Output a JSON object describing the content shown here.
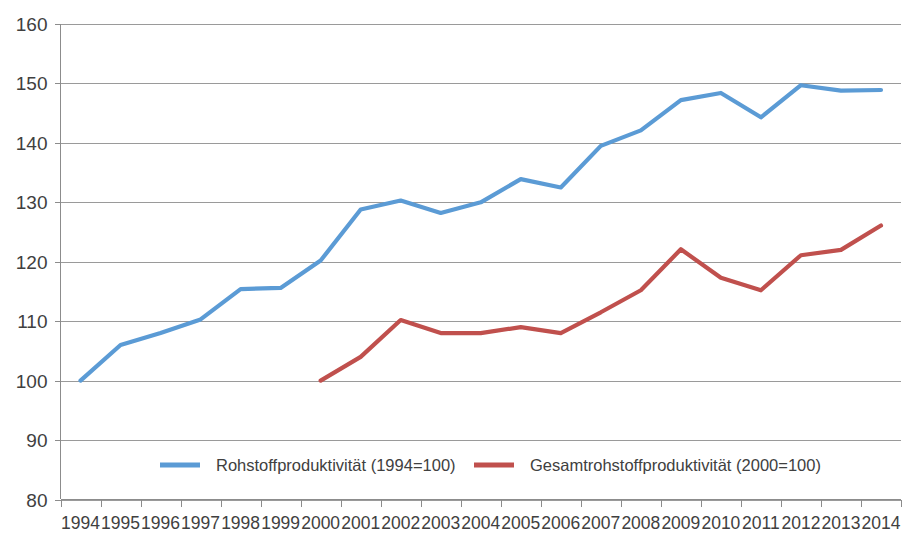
{
  "chart_data": {
    "type": "line",
    "title": "",
    "subtitle": "",
    "xlabel": "",
    "ylabel": "",
    "x": [
      1994,
      1995,
      1996,
      1997,
      1998,
      1999,
      2000,
      2001,
      2002,
      2003,
      2004,
      2005,
      2006,
      2007,
      2008,
      2009,
      2010,
      2011,
      2012,
      2013,
      2014
    ],
    "categories": [
      "1994",
      "1995",
      "1996",
      "1997",
      "1998",
      "1999",
      "2000",
      "2001",
      "2002",
      "2003",
      "2004",
      "2005",
      "2006",
      "2007",
      "2008",
      "2009",
      "2010",
      "2011",
      "2012",
      "2013",
      "2014"
    ],
    "series": [
      {
        "name": "Rohstoffproduktivität (1994=100)",
        "color": "#5B9BD5",
        "start_year": 1994,
        "values": [
          100,
          106,
          108,
          110.3,
          115.4,
          115.6,
          120.2,
          128.8,
          130.3,
          128.2,
          130,
          133.9,
          132.5,
          139.5,
          142.1,
          147.2,
          148.4,
          144.3,
          149.7,
          148.8,
          148.9
        ]
      },
      {
        "name": "Gesamtrohstoffproduktivität (2000=100)",
        "color": "#C0504D",
        "start_year": 2000,
        "values": [
          null,
          null,
          null,
          null,
          null,
          null,
          100,
          104,
          110.2,
          108,
          108,
          109,
          108,
          111.5,
          115.2,
          122.1,
          117.3,
          115.2,
          121.1,
          122,
          126.1
        ]
      }
    ],
    "ylim": [
      80,
      160
    ],
    "yticks": [
      80,
      90,
      100,
      110,
      120,
      130,
      140,
      150,
      160
    ],
    "ytick_labels": [
      "80",
      "90",
      "100",
      "110",
      "120",
      "130",
      "140",
      "150",
      "160"
    ],
    "grid": true,
    "grid_axis": "y",
    "legend_position": "inside-bottom-left",
    "legend": [
      {
        "label": "Rohstoffproduktivität (1994=100)",
        "color": "#5B9BD5"
      },
      {
        "label": "Gesamtrohstoffproduktivität (2000=100)",
        "color": "#C0504D"
      }
    ]
  },
  "axes": {
    "y_axis_name": "index-value-axis",
    "x_axis_name": "year-axis"
  }
}
